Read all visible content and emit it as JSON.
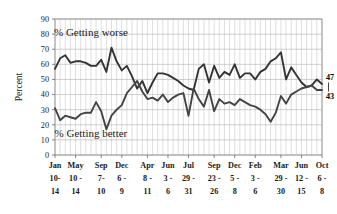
{
  "chart_data": {
    "type": "line",
    "title": "",
    "xlabel": "",
    "ylabel": "Percent",
    "ylim": [
      0,
      90
    ],
    "ytick_step": 10,
    "yticks": [
      0,
      10,
      20,
      30,
      40,
      50,
      60,
      70,
      80,
      90
    ],
    "grid": "vertical-minor-and-horizontal-major",
    "legend_position": "inline-annotations",
    "annotations": [
      {
        "text": "% Getting worse",
        "x_index": 7,
        "y_value": 79
      },
      {
        "text": "% Getting better",
        "x_index": 7,
        "y_value": 12
      }
    ],
    "end_labels": [
      {
        "text": "47",
        "series": "% Getting worse",
        "value": 47
      },
      {
        "text": "43",
        "series": "% Getting better",
        "value": 43
      }
    ],
    "x_tick_labels": [
      {
        "month": "Jan",
        "range_start": "10-",
        "range_end": "14",
        "index": 0
      },
      {
        "month": "May",
        "range_start": "10 -",
        "range_end": "14",
        "index": 4
      },
      {
        "month": "Sep",
        "range_start": "7-",
        "range_end": "10",
        "index": 9
      },
      {
        "month": "Dec",
        "range_start": "6 -",
        "range_end": "9",
        "index": 13
      },
      {
        "month": "Apr",
        "range_start": "8 -",
        "range_end": "11",
        "index": 18
      },
      {
        "month": "Jun",
        "range_start": "3 -",
        "range_end": "6",
        "index": 22
      },
      {
        "month": "Jul",
        "range_start": "29 -",
        "range_end": "31",
        "index": 26
      },
      {
        "month": "Sep",
        "range_start": "23 -",
        "range_end": "26",
        "index": 31
      },
      {
        "month": "Dec",
        "range_start": "5 -",
        "range_end": "8",
        "index": 35
      },
      {
        "month": "Feb",
        "range_start": "3 -",
        "range_end": "6",
        "index": 39
      },
      {
        "month": "Mar",
        "range_start": "29 -",
        "range_end": "30",
        "index": 44
      },
      {
        "month": "Jun",
        "range_start": "12 -",
        "range_end": "15",
        "index": 48
      },
      {
        "month": "Oct",
        "range_start": "6 -",
        "range_end": "8",
        "index": 52
      }
    ],
    "n_points": 53,
    "series": [
      {
        "name": "% Getting worse",
        "color": "#333333",
        "values": [
          57,
          64,
          66,
          61,
          62,
          62,
          61,
          59,
          59,
          63,
          55,
          71,
          62,
          56,
          59,
          52,
          44,
          49,
          41,
          48,
          54,
          54,
          53,
          51,
          49,
          46,
          44,
          43,
          57,
          60,
          48,
          59,
          51,
          55,
          53,
          60,
          51,
          54,
          54,
          50,
          55,
          57,
          62,
          64,
          68,
          50,
          58,
          53,
          48,
          45,
          46,
          50,
          47
        ]
      },
      {
        "name": "% Getting better",
        "color": "#444444",
        "values": [
          31,
          23,
          26,
          25,
          24,
          27,
          28,
          28,
          35,
          29,
          17,
          26,
          30,
          33,
          41,
          45,
          49,
          42,
          37,
          38,
          36,
          40,
          35,
          38,
          40,
          41,
          26,
          44,
          37,
          32,
          43,
          29,
          37,
          34,
          35,
          33,
          37,
          35,
          33,
          32,
          30,
          27,
          22,
          28,
          39,
          34,
          40,
          42,
          44,
          45,
          46,
          43,
          43
        ]
      }
    ]
  }
}
